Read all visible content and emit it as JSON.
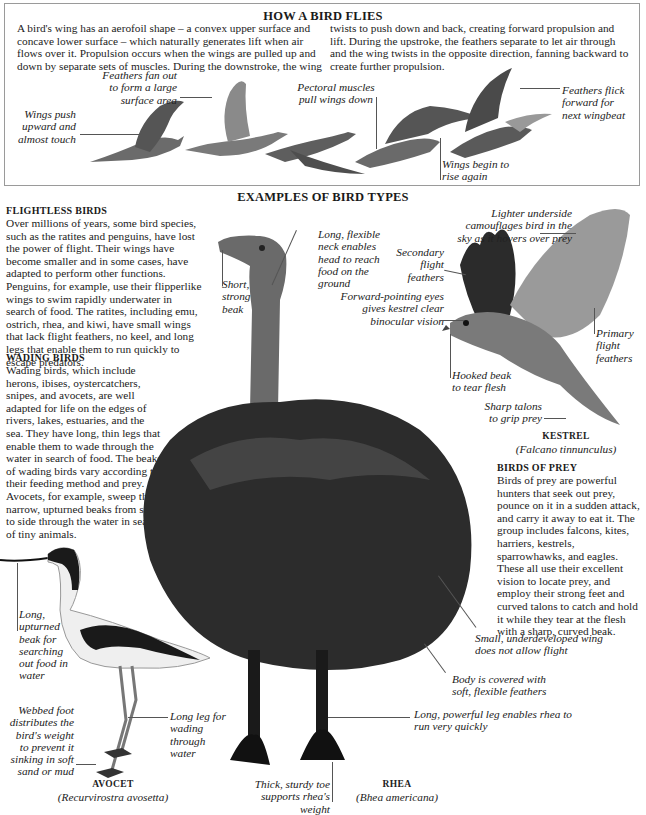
{
  "flight_section": {
    "title": "HOW A BIRD FLIES",
    "paragraph_left": "A bird's wing has an aerofoil shape – a convex upper surface and concave lower surface – which naturally generates lift when air flows over it. Propulsion occurs when the wings are pulled up and down by separate sets of muscles. During the downstroke, the wing",
    "paragraph_right": "twists to push down and back, creating forward propulsion and lift. During the upstroke, the feathers separate to let air through and the wing twists in the opposite direction, fanning backward to create further propulsion.",
    "captions": {
      "wings_push": "Wings push upward and almost touch",
      "feathers_fan": "Feathers fan out to form a large surface area",
      "pectoral": "Pectoral muscles pull wings down",
      "wings_rise": "Wings begin to rise again",
      "feathers_flick": "Feathers flick forward for next wingbeat"
    }
  },
  "types_section": {
    "title": "EXAMPLES OF BIRD TYPES",
    "flightless": {
      "heading": "FLIGHTLESS BIRDS",
      "text": "Over millions of years, some bird species, such as the ratites and penguins, have lost the power of flight. Their wings have become smaller and in some cases, have adapted to perform other functions. Penguins, for example, use their flipperlike wings to swim rapidly underwater in search of food. The ratites, including emu, ostrich, rhea, and kiwi, have small wings that lack flight feathers, no keel, and long legs that enable them to run quickly to escape predators."
    },
    "wading": {
      "heading": "WADING BIRDS",
      "text": "Wading birds, which include herons, ibises, oystercatchers, snipes, and avocets, are well adapted for life on the edges of rivers, lakes, estuaries, and the sea. They have long, thin legs that enable them to wade through the water in search of food. The beaks of wading birds vary according to their feeding method and prey. Avocets, for example, sweep their narrow, upturned beaks from side to side through the water in search of tiny animals."
    },
    "prey": {
      "heading": "BIRDS OF PREY",
      "text": "Birds of prey are powerful hunters that seek out prey, pounce on it in a sudden attack, and carry it away to eat it. The group includes falcons, kites, harriers, kestrels, sparrowhawks, and eagles. These all use their excellent vision to locate prey, and employ their strong feet and curved talons to catch and hold it while they tear at the flesh with a sharp, curved beak."
    },
    "rhea": {
      "name": "RHEA",
      "latin": "(Bhea americana)",
      "captions": {
        "beak": "Short, strong beak",
        "neck": "Long, flexible neck enables head to reach food on the ground",
        "wing": "Small, underdeveloped wing does not allow flight",
        "body": "Body is covered with soft, flexible feathers",
        "leg": "Long, powerful leg enables rhea to run very quickly",
        "toe": "Thick, sturdy toe supports rhea's weight"
      }
    },
    "kestrel": {
      "name": "KESTREL",
      "latin": "(Falcano tinnunculus)",
      "captions": {
        "underside": "Lighter underside camouflages bird in the sky as it hovers over prey",
        "secondary": "Secondary flight feathers",
        "eyes": "Forward-pointing eyes gives kestrel clear binocular vision",
        "primary": "Primary flight feathers",
        "beak": "Hooked beak to tear flesh",
        "talons": "Sharp talons to grip prey"
      }
    },
    "avocet": {
      "name": "AVOCET",
      "latin": "(Recurvirostra avosetta)",
      "captions": {
        "beak": "Long, upturned beak for searching out food in water",
        "foot": "Webbed foot distributes the bird's weight to prevent it sinking in soft sand or mud",
        "leg": "Long leg for wading through water"
      }
    }
  },
  "colors": {
    "text": "#222222",
    "border": "#9a9a9a",
    "background": "#ffffff"
  }
}
